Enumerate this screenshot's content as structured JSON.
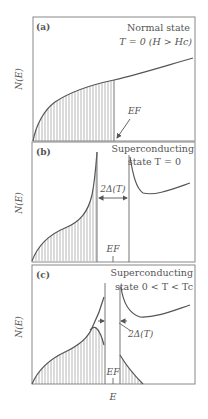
{
  "figure": {
    "x_axis_label": "E",
    "y_axis_label": "N(E)",
    "panels": [
      {
        "id": "a",
        "tag": "(a)",
        "title_line1": "Normal state",
        "title_line2": "T = 0 (H > Hc)",
        "fermi_label": "EF",
        "description": "Normal-state density of states, filled up to Fermi energy"
      },
      {
        "id": "b",
        "tag": "(b)",
        "title_line1": "Superconducting",
        "title_line2": "state T = 0",
        "gap_label": "2Δ(T)",
        "fermi_label": "EF",
        "description": "BCS density of states with full gap at T=0"
      },
      {
        "id": "c",
        "tag": "(c)",
        "title_line1": "Superconducting",
        "title_line2": "state 0 < T < Tc",
        "gap_label": "2Δ(T)",
        "fermi_label": "EF",
        "description": "Reduced gap at finite temperature with thermal occupation above gap"
      }
    ]
  }
}
